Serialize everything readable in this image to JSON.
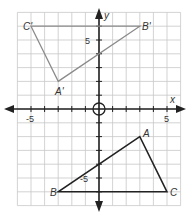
{
  "graph": {
    "x_axis_label": "x",
    "y_axis_label": "y",
    "x_range": [
      -6,
      6
    ],
    "y_range": [
      -7,
      7
    ],
    "tick_labels": {
      "x_neg": "-5",
      "x_pos": "5",
      "y_pos": "5",
      "y_neg": "-5"
    },
    "colors": {
      "grid": "#c8c8c8",
      "axis": "#222222",
      "original_triangle": "#222222",
      "image_triangle": "#8a8a8a"
    }
  },
  "triangle_original": {
    "name": "ABC",
    "vertices": [
      {
        "label": "A",
        "x": 3,
        "y": -2
      },
      {
        "label": "B",
        "x": -3,
        "y": -6
      },
      {
        "label": "C",
        "x": 5,
        "y": -6
      }
    ]
  },
  "triangle_image": {
    "name": "A'B'C'",
    "vertices": [
      {
        "label": "A'",
        "x": -3,
        "y": 2
      },
      {
        "label": "B'",
        "x": 3,
        "y": 6
      },
      {
        "label": "C'",
        "x": -5,
        "y": 6
      }
    ]
  },
  "origin_marker": "circle"
}
